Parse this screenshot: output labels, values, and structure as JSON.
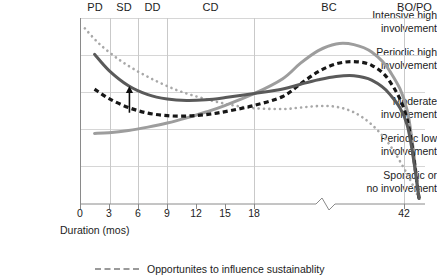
{
  "chart_data": {
    "type": "line",
    "title": "",
    "xlabel": "Duration (mos)",
    "ylabel": "",
    "grid": true,
    "legend_position": "bottom",
    "xlim": [
      0,
      45
    ],
    "axis_break": {
      "present": true,
      "after_tick": "18",
      "before_tick": "42"
    },
    "xticks": [
      "0",
      "3",
      "6",
      "9",
      "12",
      "15",
      "18",
      "42"
    ],
    "ycategories": [
      "Intensive high involvement",
      "Periodic high involvement",
      "Moderate involvement",
      "Periodic low involvement",
      "Sporadic or no involvement"
    ],
    "phases": [
      {
        "code": "PD"
      },
      {
        "code": "SD"
      },
      {
        "code": "DD"
      },
      {
        "code": "CD"
      },
      {
        "code": "BC"
      },
      {
        "code": "BO/PO"
      }
    ],
    "series": [
      {
        "name": "Opportunites to influence sustainablity",
        "style": "dotted",
        "color": "#a8a8a8",
        "points": [
          [
            0.5,
            4.72
          ],
          [
            2,
            4.3
          ],
          [
            4,
            3.88
          ],
          [
            6,
            3.55
          ],
          [
            8,
            3.28
          ],
          [
            10,
            3.05
          ],
          [
            12,
            2.88
          ],
          [
            14,
            2.74
          ],
          [
            16,
            2.63
          ],
          [
            18,
            2.56
          ],
          [
            21,
            2.54
          ],
          [
            24,
            2.58
          ],
          [
            27,
            2.62
          ],
          [
            30,
            2.6
          ],
          [
            33,
            2.45
          ],
          [
            36,
            2.12
          ],
          [
            39,
            1.58
          ],
          [
            42,
            0.78
          ],
          [
            44,
            0.12
          ]
        ]
      },
      {
        "name": "dark-gray-solid-curve",
        "style": "solid",
        "color": "#5a5a5a",
        "points": [
          [
            1.5,
            4.02
          ],
          [
            3,
            3.58
          ],
          [
            5,
            3.17
          ],
          [
            7,
            2.93
          ],
          [
            9,
            2.81
          ],
          [
            11,
            2.77
          ],
          [
            13,
            2.79
          ],
          [
            15,
            2.85
          ],
          [
            18,
            2.96
          ],
          [
            21,
            3.08
          ],
          [
            24,
            3.21
          ],
          [
            27,
            3.33
          ],
          [
            30,
            3.42
          ],
          [
            33,
            3.44
          ],
          [
            36,
            3.32
          ],
          [
            39,
            2.95
          ],
          [
            42,
            2.1
          ],
          [
            44,
            0.12
          ]
        ]
      },
      {
        "name": "black-dashed-curve",
        "style": "dashed",
        "color": "#171717",
        "points": [
          [
            1.5,
            3.08
          ],
          [
            3,
            2.82
          ],
          [
            5,
            2.58
          ],
          [
            7,
            2.43
          ],
          [
            9,
            2.36
          ],
          [
            11,
            2.35
          ],
          [
            13,
            2.39
          ],
          [
            15,
            2.47
          ],
          [
            18,
            2.64
          ],
          [
            21,
            2.88
          ],
          [
            24,
            3.22
          ],
          [
            27,
            3.55
          ],
          [
            30,
            3.76
          ],
          [
            33,
            3.82
          ],
          [
            36,
            3.72
          ],
          [
            39,
            3.3
          ],
          [
            42,
            2.25
          ],
          [
            44,
            0.12
          ]
        ]
      },
      {
        "name": "light-gray-solid-curve",
        "style": "solid",
        "color": "#9d9d9d",
        "points": [
          [
            1.5,
            1.88
          ],
          [
            3,
            1.9
          ],
          [
            5,
            1.96
          ],
          [
            7,
            2.05
          ],
          [
            9,
            2.16
          ],
          [
            11,
            2.3
          ],
          [
            13,
            2.46
          ],
          [
            15,
            2.64
          ],
          [
            18,
            2.96
          ],
          [
            21,
            3.36
          ],
          [
            24,
            3.78
          ],
          [
            27,
            4.12
          ],
          [
            30,
            4.3
          ],
          [
            33,
            4.28
          ],
          [
            36,
            4.08
          ],
          [
            39,
            3.58
          ],
          [
            42,
            2.5
          ],
          [
            44,
            0.12
          ]
        ]
      }
    ],
    "annotation": {
      "type": "arrow",
      "direction": "up",
      "x": 5.1,
      "y_from": 2.44,
      "y_to": 3.16
    }
  },
  "legend": {
    "items": [
      {
        "label": "Opportunites to influence sustainablity",
        "style": "dotted",
        "color": "#9a9a9a"
      }
    ]
  }
}
